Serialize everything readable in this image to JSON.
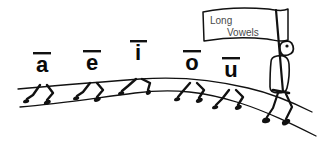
{
  "illustration": {
    "title": "Long Vowels marching figures",
    "background_color": "#ffffff",
    "ink_color": "#111111",
    "flag_text_color": "#4a4a4a"
  },
  "flag": {
    "line1": "Long",
    "line2": "Vowels"
  },
  "vowels": [
    {
      "letter": "a",
      "macron": "¯",
      "label": "long-a",
      "x": 42,
      "y": 72,
      "size": 22
    },
    {
      "letter": "e",
      "macron": "¯",
      "label": "long-e",
      "x": 92,
      "y": 70,
      "size": 22
    },
    {
      "letter": "i",
      "macron": "¯",
      "label": "long-i",
      "x": 138,
      "y": 60,
      "size": 22
    },
    {
      "letter": "o",
      "macron": "¯",
      "label": "long-o",
      "x": 192,
      "y": 70,
      "size": 22
    },
    {
      "letter": "u",
      "macron": "¯",
      "label": "long-u",
      "x": 231,
      "y": 77,
      "size": 22
    }
  ],
  "figures": {
    "flag_bearer_label": "flag-bearer",
    "ground_upper_label": "upper-ground-line",
    "ground_lower_label": "lower-ground-line"
  }
}
